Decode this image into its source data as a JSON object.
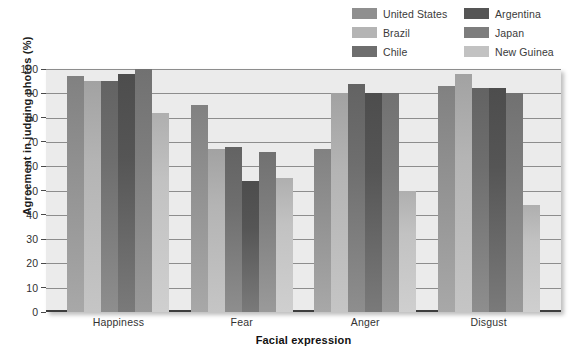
{
  "chart_data": {
    "type": "bar",
    "title": "",
    "xlabel": "Facial expression",
    "ylabel": "Agreement in judging photos (%)",
    "ylim": [
      0,
      100
    ],
    "ytick_step": 10,
    "yticks": [
      100,
      90,
      80,
      70,
      60,
      50,
      40,
      30,
      20,
      10,
      0
    ],
    "grid": true,
    "legend_position": "top-right",
    "categories": [
      "Happiness",
      "Fear",
      "Anger",
      "Disgust"
    ],
    "series": [
      {
        "name": "United States",
        "color": "#8f8f8f",
        "values": [
          97,
          85,
          67,
          93
        ]
      },
      {
        "name": "Brazil",
        "color": "#b4b4b4",
        "values": [
          95,
          67,
          90,
          98
        ]
      },
      {
        "name": "Chile",
        "color": "#6e6e6e",
        "values": [
          95,
          68,
          94,
          92
        ]
      },
      {
        "name": "Argentina",
        "color": "#555555",
        "values": [
          98,
          54,
          90,
          92
        ]
      },
      {
        "name": "Japan",
        "color": "#7d7d7d",
        "values": [
          100,
          66,
          90,
          90
        ]
      },
      {
        "name": "New Guinea",
        "color": "#c2c2c2",
        "values": [
          82,
          55,
          50,
          44
        ]
      }
    ]
  },
  "legend": {
    "entries": [
      {
        "label": "United States"
      },
      {
        "label": "Argentina"
      },
      {
        "label": "Brazil"
      },
      {
        "label": "Japan"
      },
      {
        "label": "Chile"
      },
      {
        "label": "New Guinea"
      }
    ]
  }
}
